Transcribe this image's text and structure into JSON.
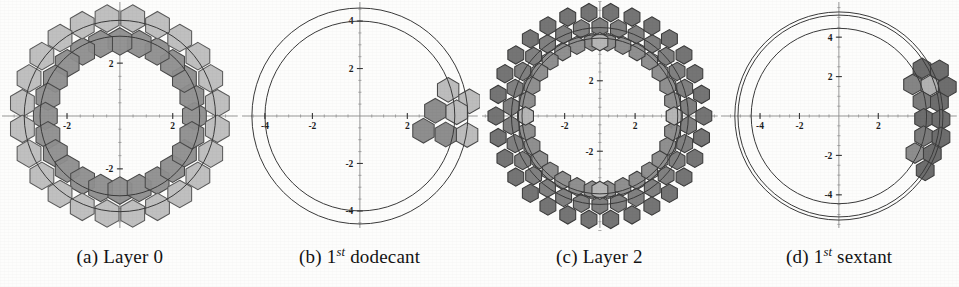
{
  "figure": {
    "kind": "multi-panel-scatter-diagram",
    "background_color": "#fdfdfc",
    "panel_count": 4
  },
  "panels": [
    {
      "id": "panel-a",
      "caption_label": "(a)",
      "caption_text": "Layer 0",
      "caption_superscript": "",
      "caption_suffix": "",
      "axis": {
        "x_ticks": [
          -2,
          2
        ],
        "y_ticks": [
          -2,
          2
        ],
        "x_tick_labels": [
          "-2",
          "2"
        ],
        "y_tick_labels": [
          "-2",
          "2"
        ],
        "xlim": [
          -4.4,
          4.4
        ],
        "ylim": [
          -4.4,
          4.4
        ],
        "axis_color": "#8c8c8c",
        "label_color": "#1c1c1c"
      },
      "circles": [
        {
          "radius": 3.02,
          "color": "#3a3a3a"
        },
        {
          "radius": 3.62,
          "color": "#3a3a3a"
        }
      ],
      "hex_radius": 0.52,
      "hex_rings": [
        {
          "name": "inner-ring",
          "count": 24,
          "ring_radius": 2.82,
          "angle_offset": 0,
          "fill": "#8e8e8e",
          "stroke": "#4a4a4a"
        },
        {
          "name": "outer-ring",
          "count": 24,
          "ring_radius": 3.72,
          "angle_offset": 7.5,
          "fill": "#bdbdbd",
          "stroke": "#5a5a5a"
        }
      ]
    },
    {
      "id": "panel-b",
      "caption_label": "(b)",
      "caption_text": "1",
      "caption_superscript": "st",
      "caption_suffix": "dodecant",
      "axis": {
        "x_ticks": [
          -4,
          -2,
          2
        ],
        "y_ticks": [
          -4,
          -2,
          2,
          4
        ],
        "x_tick_labels": [
          "-4",
          "-2",
          "2"
        ],
        "y_tick_labels": [
          "-4",
          "-2",
          "2",
          "4"
        ],
        "xlim": [
          -4.9,
          4.9
        ],
        "ylim": [
          -4.9,
          4.9
        ],
        "axis_color": "#8c8c8c",
        "label_color": "#1c1c1c"
      },
      "circles": [
        {
          "radius": 4.0,
          "color": "#3a3a3a"
        },
        {
          "radius": 4.55,
          "color": "#3a3a3a"
        }
      ],
      "hex_radius": 0.52,
      "hex_cluster": {
        "name": "first-dodecant-cluster",
        "count": 7,
        "cells": [
          {
            "x": 3.72,
            "y": 1.1,
            "fill": "#bdbdbd"
          },
          {
            "x": 4.62,
            "y": 0.62,
            "fill": "#bdbdbd"
          },
          {
            "x": 3.18,
            "y": 0.22,
            "fill": "#8e8e8e"
          },
          {
            "x": 4.08,
            "y": 0.16,
            "fill": "#bdbdbd"
          },
          {
            "x": 2.68,
            "y": -0.62,
            "fill": "#8e8e8e"
          },
          {
            "x": 3.62,
            "y": -0.78,
            "fill": "#8e8e8e"
          },
          {
            "x": 4.52,
            "y": -0.8,
            "fill": "#bdbdbd"
          }
        ],
        "stroke": "#4a4a4a"
      }
    },
    {
      "id": "panel-c",
      "caption_label": "(c)",
      "caption_text": "Layer 2",
      "caption_superscript": "",
      "caption_suffix": "",
      "axis": {
        "x_ticks": [
          -2,
          2,
          4
        ],
        "y_ticks": [
          -2,
          2,
          4
        ],
        "x_tick_labels": [
          "-2",
          "2",
          "4"
        ],
        "y_tick_labels": [
          "-2",
          "2",
          "4"
        ],
        "xlim": [
          -6.6,
          6.6
        ],
        "ylim": [
          -6.6,
          6.6
        ],
        "axis_color": "#8c8c8c",
        "label_color": "#1c1c1c"
      },
      "circles": [
        {
          "radius": 4.42,
          "color": "#3a3a3a"
        },
        {
          "radius": 4.62,
          "color": "#3a3a3a"
        },
        {
          "radius": 5.02,
          "color": "#3a3a3a"
        }
      ],
      "hex_radius": 0.52,
      "hex_rings": [
        {
          "name": "inner-ring",
          "count": 30,
          "ring_radius": 4.22,
          "angle_offset": 0,
          "fill": "#8a8a8a",
          "stroke": "#3d3d3d"
        },
        {
          "name": "middle-ring",
          "count": 30,
          "ring_radius": 5.06,
          "angle_offset": 6,
          "fill": "#7a7a7a",
          "stroke": "#3d3d3d"
        },
        {
          "name": "outer-ring",
          "count": 30,
          "ring_radius": 5.9,
          "angle_offset": 0,
          "fill": "#6e6e6e",
          "stroke": "#3a3a3a"
        }
      ],
      "highlight_cells": [
        {
          "x": 0.0,
          "y": 4.22,
          "fill": "#b6b6b6"
        },
        {
          "x": 4.22,
          "y": 0.0,
          "fill": "#b6b6b6"
        },
        {
          "x": -4.22,
          "y": 0.0,
          "fill": "#b6b6b6"
        },
        {
          "x": 0.0,
          "y": -4.22,
          "fill": "#b6b6b6"
        }
      ]
    },
    {
      "id": "panel-d",
      "caption_label": "(d)",
      "caption_text": "1",
      "caption_superscript": "st",
      "caption_suffix": "sextant",
      "axis": {
        "x_ticks": [
          -4,
          -2,
          2
        ],
        "y_ticks": [
          -4,
          -2,
          2,
          4
        ],
        "x_tick_labels": [
          "-4",
          "-2",
          "2"
        ],
        "y_tick_labels": [
          "-4",
          "-2",
          "2",
          "4"
        ],
        "xlim": [
          -5.9,
          5.9
        ],
        "ylim": [
          -5.9,
          5.9
        ],
        "axis_color": "#8c8c8c",
        "label_color": "#1c1c1c"
      },
      "circles": [
        {
          "radius": 4.45,
          "color": "#3a3a3a"
        },
        {
          "radius": 5.12,
          "color": "#3a3a3a"
        },
        {
          "radius": 5.28,
          "color": "#3a3a3a"
        }
      ],
      "hex_radius": 0.52,
      "hex_cluster": {
        "name": "first-sextant-cluster",
        "count": 14,
        "cells": [
          {
            "x": 4.22,
            "y": 2.42,
            "fill": "#6e6e6e"
          },
          {
            "x": 5.1,
            "y": 2.32,
            "fill": "#6e6e6e"
          },
          {
            "x": 3.74,
            "y": 1.6,
            "fill": "#858585"
          },
          {
            "x": 4.62,
            "y": 1.54,
            "fill": "#b2b2b2"
          },
          {
            "x": 5.5,
            "y": 1.48,
            "fill": "#6e6e6e"
          },
          {
            "x": 4.22,
            "y": 0.74,
            "fill": "#7c7c7c"
          },
          {
            "x": 5.1,
            "y": 0.7,
            "fill": "#6e6e6e"
          },
          {
            "x": 4.3,
            "y": -0.14,
            "fill": "#6e6e6e"
          },
          {
            "x": 5.18,
            "y": -0.18,
            "fill": "#6e6e6e"
          },
          {
            "x": 4.3,
            "y": -1.02,
            "fill": "#7c7c7c"
          },
          {
            "x": 5.18,
            "y": -1.08,
            "fill": "#6e6e6e"
          },
          {
            "x": 3.86,
            "y": -1.88,
            "fill": "#8e8e8e"
          },
          {
            "x": 4.74,
            "y": -1.92,
            "fill": "#6e6e6e"
          },
          {
            "x": 4.38,
            "y": -2.76,
            "fill": "#6e6e6e"
          }
        ],
        "stroke": "#3d3d3d"
      }
    }
  ]
}
